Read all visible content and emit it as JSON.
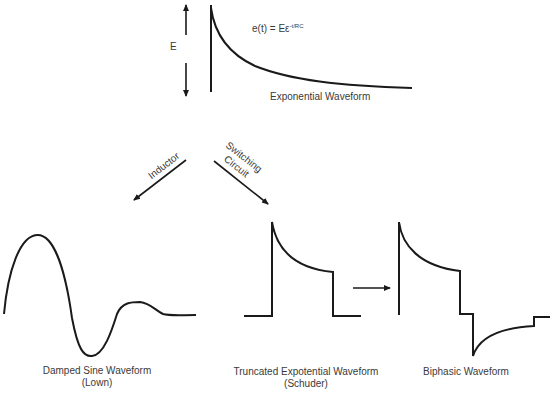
{
  "top": {
    "amplitude_label": "E",
    "equation_base": "e(t) = Eε",
    "equation_exponent": "-t/RC",
    "caption": "Exponential Waveform"
  },
  "branches": {
    "left_label": "Inductor",
    "right_label_line1": "Switching",
    "right_label_line2": "Circuit"
  },
  "waveforms": [
    {
      "title": "Damped Sine Waveform",
      "subtitle": "(Lown)"
    },
    {
      "title": "Truncated Expotential Waveform",
      "subtitle": "(Schuder)"
    },
    {
      "title": "Biphasic Waveform",
      "subtitle": ""
    }
  ],
  "colors": {
    "stroke": "#1a1a1a",
    "text": "#3a3a3a",
    "background": "#ffffff"
  }
}
